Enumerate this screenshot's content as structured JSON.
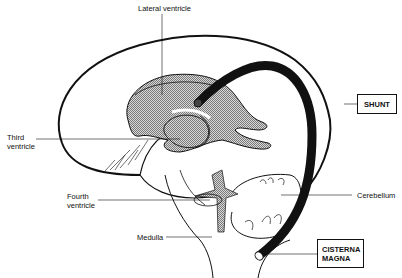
{
  "diagram": {
    "type": "anatomical illustration",
    "labels": {
      "lateral_ventricle": "Lateral ventricle",
      "third_ventricle_line1": "Third",
      "third_ventricle_line2": "ventricle",
      "fourth_ventricle_line1": "Fourth",
      "fourth_ventricle_line2": "ventricle",
      "medulla": "Medulla",
      "cerebellum": "Cerebellum"
    },
    "boxes": {
      "shunt": "SHUNT",
      "cisterna_magna_line1": "CISTERNA",
      "cisterna_magna_line2": "MAGNA"
    },
    "colors": {
      "outline": "#111111",
      "ventricle_fill": "#b8b8b8",
      "background": "#ffffff"
    }
  }
}
